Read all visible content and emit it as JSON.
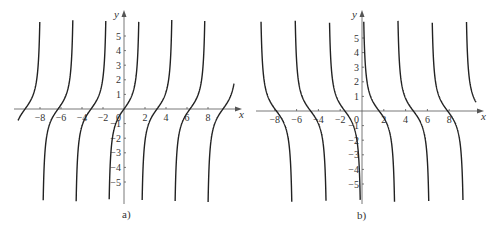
{
  "chart_data": [
    {
      "type": "line",
      "panel_label": "a)",
      "function": "tan(x)",
      "xlabel": "x",
      "ylabel": "y",
      "xlim": [
        -10,
        10
      ],
      "ylim": [
        -6,
        6
      ],
      "x_ticks": [
        -8,
        -6,
        -4,
        -2,
        2,
        4,
        6,
        8
      ],
      "x_tick_labels": [
        "-8",
        "-6",
        "-4",
        "-2",
        "2",
        "4",
        "6",
        "8"
      ],
      "y_ticks": [
        5,
        4,
        3,
        2,
        1,
        -1,
        -2,
        -3,
        -4,
        -5
      ],
      "y_tick_labels": [
        "5",
        "4",
        "3",
        "2",
        "1",
        "-1",
        "-2",
        "-3",
        "-4",
        "-5"
      ],
      "origin_label": "0",
      "zeros": [
        -9.42,
        -6.28,
        -3.14,
        0,
        3.14,
        6.28,
        9.42
      ],
      "asymptotes": [
        -7.85,
        -4.71,
        -1.57,
        1.57,
        4.71,
        7.85
      ],
      "grid": false
    },
    {
      "type": "line",
      "panel_label": "b)",
      "function": "cot(x)",
      "xlabel": "x",
      "ylabel": "y",
      "xlim": [
        -10,
        10
      ],
      "ylim": [
        -6,
        6
      ],
      "x_ticks": [
        -8,
        -6,
        -4,
        -2,
        2,
        4,
        6,
        8
      ],
      "x_tick_labels": [
        "-8",
        "-6",
        "-4",
        "-2",
        "2",
        "4",
        "6",
        "8"
      ],
      "y_ticks": [
        5,
        4,
        3,
        2,
        1,
        -1,
        -2,
        -3,
        -4,
        -5
      ],
      "y_tick_labels": [
        "5",
        "4",
        "3",
        "2",
        "1",
        "-1",
        "-2",
        "-3",
        "-4",
        "-5"
      ],
      "origin_label": "0",
      "zeros": [
        -7.85,
        -4.71,
        -1.57,
        1.57,
        4.71,
        7.85
      ],
      "asymptotes": [
        -9.42,
        -6.28,
        -3.14,
        0,
        3.14,
        6.28,
        9.42
      ],
      "grid": false
    }
  ],
  "panels": {
    "a": {
      "label": "a)",
      "x_axis_label": "x",
      "y_axis_label": "y",
      "origin": "0"
    },
    "b": {
      "label": "b)",
      "x_axis_label": "x",
      "y_axis_label": "y",
      "origin": "0"
    }
  }
}
